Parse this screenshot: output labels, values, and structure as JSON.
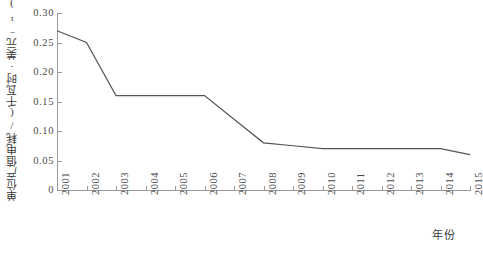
{
  "chart_data": {
    "type": "line",
    "title": "",
    "xlabel": "年份",
    "ylabel": "单位产值电耗/(千瓦时·美元⁻¹)",
    "categories": [
      "2001",
      "2002",
      "2003",
      "2004",
      "2005",
      "2006",
      "2007",
      "2008",
      "2009",
      "2010",
      "2011",
      "2012",
      "2013",
      "2014",
      "2015"
    ],
    "values": [
      0.27,
      0.25,
      0.16,
      0.16,
      0.16,
      0.16,
      0.12,
      0.08,
      0.075,
      0.07,
      0.07,
      0.07,
      0.07,
      0.07,
      0.06
    ],
    "series": [
      {
        "name": "单位产值电耗",
        "values": [
          0.27,
          0.25,
          0.16,
          0.16,
          0.16,
          0.16,
          0.12,
          0.08,
          0.075,
          0.07,
          0.07,
          0.07,
          0.07,
          0.07,
          0.06
        ]
      }
    ],
    "ylim": [
      0,
      0.3
    ],
    "yticks": [
      "0",
      "0.05",
      "0.10",
      "0.15",
      "0.20",
      "0.25",
      "0.30"
    ],
    "ytick_values": [
      0,
      0.05,
      0.1,
      0.15,
      0.2,
      0.25,
      0.3
    ],
    "xlim": [
      "2001",
      "2015"
    ],
    "grid": false,
    "legend": false,
    "line_color": "#555555",
    "axis_color": "#9a9a9a"
  }
}
